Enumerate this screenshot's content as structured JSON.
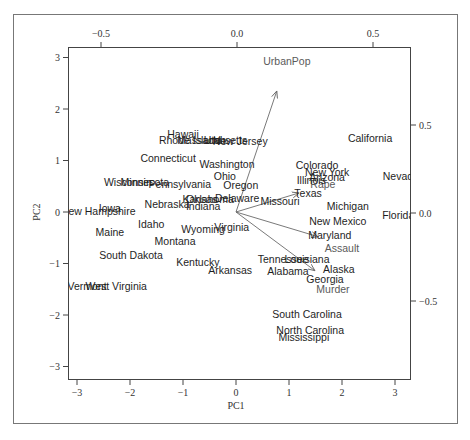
{
  "chart_data": {
    "type": "scatter",
    "subtype": "pca-biplot",
    "title": "",
    "xlabel": "PC1",
    "ylabel": "PC2",
    "xlim": [
      -3.2,
      3.3
    ],
    "ylim": [
      -3.2,
      3.2
    ],
    "x_ticks": [
      "-3",
      "-2",
      "-1",
      "0",
      "1",
      "2",
      "3"
    ],
    "y_ticks": [
      "-3",
      "-2",
      "-1",
      "0",
      "1",
      "2",
      "3"
    ],
    "top_ticks": [
      "-0.5",
      "0.0",
      "0.5"
    ],
    "right_ticks": [
      "0.5",
      "0.0",
      "-0.5"
    ],
    "loadings_lim": [
      -0.62,
      0.62
    ],
    "grid": false,
    "legend": null,
    "points": [
      {
        "label": "California",
        "x": 2.53,
        "y": 1.44
      },
      {
        "label": "Hawaii",
        "x": -1.0,
        "y": 1.52
      },
      {
        "label": "Rhode Island",
        "x": -0.87,
        "y": 1.4
      },
      {
        "label": "Massachusetts",
        "x": -0.45,
        "y": 1.4
      },
      {
        "label": "Utah",
        "x": -0.4,
        "y": 1.4
      },
      {
        "label": "New Jersey",
        "x": 0.08,
        "y": 1.38
      },
      {
        "label": "Connecticut",
        "x": -1.28,
        "y": 1.05
      },
      {
        "label": "Washington",
        "x": -0.17,
        "y": 0.93
      },
      {
        "label": "Colorado",
        "x": 1.53,
        "y": 0.91
      },
      {
        "label": "New York",
        "x": 1.72,
        "y": 0.78
      },
      {
        "label": "Arizona",
        "x": 1.72,
        "y": 0.68
      },
      {
        "label": "Illinois",
        "x": 1.42,
        "y": 0.62
      },
      {
        "label": "Nevada",
        "x": 3.11,
        "y": 0.7
      },
      {
        "label": "Ohio",
        "x": -0.21,
        "y": 0.7
      },
      {
        "label": "Wisconsin",
        "x": -2.04,
        "y": 0.58
      },
      {
        "label": "Minnesota",
        "x": -1.72,
        "y": 0.58
      },
      {
        "label": "Pennsylvania",
        "x": -1.06,
        "y": 0.54
      },
      {
        "label": "Oregon",
        "x": 0.09,
        "y": 0.52
      },
      {
        "label": "Texas",
        "x": 1.36,
        "y": 0.37
      },
      {
        "label": "Michigan",
        "x": 2.11,
        "y": 0.12
      },
      {
        "label": "Kansas",
        "x": -0.68,
        "y": 0.25
      },
      {
        "label": "Oklahoma",
        "x": -0.49,
        "y": 0.25
      },
      {
        "label": "Delaware",
        "x": 0.02,
        "y": 0.27
      },
      {
        "label": "Missouri",
        "x": 0.83,
        "y": 0.21
      },
      {
        "label": "Nebraska",
        "x": -1.3,
        "y": 0.16
      },
      {
        "label": "Indiana",
        "x": -0.62,
        "y": 0.12
      },
      {
        "label": "Iowa",
        "x": -2.38,
        "y": 0.08
      },
      {
        "label": "New Hampshire",
        "x": -2.6,
        "y": 0.02
      },
      {
        "label": "Florida",
        "x": 3.06,
        "y": -0.06
      },
      {
        "label": "New Mexico",
        "x": 1.92,
        "y": -0.17
      },
      {
        "label": "Idaho",
        "x": -1.6,
        "y": -0.23
      },
      {
        "label": "Virginia",
        "x": -0.08,
        "y": -0.29
      },
      {
        "label": "Wyoming",
        "x": -0.62,
        "y": -0.33
      },
      {
        "label": "Maine",
        "x": -2.38,
        "y": -0.39
      },
      {
        "label": "Maryland",
        "x": 1.77,
        "y": -0.45
      },
      {
        "label": "North Dakota",
        "x": -3.79,
        "y": -0.56
      },
      {
        "label": "Montana",
        "x": -1.15,
        "y": -0.56
      },
      {
        "label": "South Dakota",
        "x": -1.98,
        "y": -0.83
      },
      {
        "label": "Tennessee",
        "x": 0.89,
        "y": -0.91
      },
      {
        "label": "Louisiana",
        "x": 1.34,
        "y": -0.91
      },
      {
        "label": "Kentucky",
        "x": -0.72,
        "y": -0.97
      },
      {
        "label": "Alaska",
        "x": 1.94,
        "y": -1.11
      },
      {
        "label": "Arkansas",
        "x": -0.11,
        "y": -1.13
      },
      {
        "label": "Alabama",
        "x": 0.98,
        "y": -1.15
      },
      {
        "label": "Georgia",
        "x": 1.68,
        "y": -1.3
      },
      {
        "label": "Vermont",
        "x": -2.81,
        "y": -1.44
      },
      {
        "label": "West Virginia",
        "x": -2.26,
        "y": -1.44
      },
      {
        "label": "South Carolina",
        "x": 1.34,
        "y": -1.98
      },
      {
        "label": "North Carolina",
        "x": 1.4,
        "y": -2.29
      },
      {
        "label": "Mississippi",
        "x": 1.28,
        "y": -2.43
      }
    ],
    "loadings": [
      {
        "label": "UrbanPop",
        "x": 0.77,
        "y": 2.35,
        "label_x": 0.96,
        "label_y": 2.93
      },
      {
        "label": "Rape",
        "x": 1.19,
        "y": 0.37,
        "label_x": 1.64,
        "label_y": 0.55
      },
      {
        "label": "Assault",
        "x": 1.55,
        "y": -0.48,
        "label_x": 2.0,
        "label_y": -0.7
      },
      {
        "label": "Murder",
        "x": 1.49,
        "y": -1.14,
        "label_x": 1.83,
        "label_y": -1.49
      }
    ]
  },
  "style": {
    "state_color": "#1e1e1e",
    "variable_color": "#5a5a5a",
    "arrow_color": "#6a6a6a",
    "axis_color": "#444444"
  }
}
